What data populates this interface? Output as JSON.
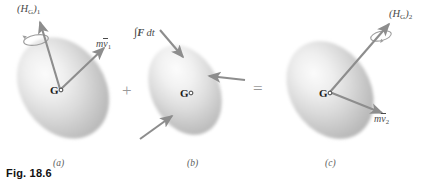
{
  "figure": {
    "caption": "Fig. 18.6",
    "panels": [
      {
        "id": "a",
        "letter": "(a)",
        "labels": {
          "angular_momentum": "(H",
          "angular_momentum_sub": "G",
          "angular_momentum_close": ")",
          "angular_momentum_index": "1",
          "linear_momentum_m": "m",
          "linear_momentum_v": "v",
          "linear_momentum_index": "1",
          "centroid": "G"
        }
      },
      {
        "id": "b",
        "letter": "(b)",
        "labels": {
          "impulse_integral": "∫",
          "impulse_force": "F",
          "impulse_dt": "dt",
          "centroid": "G"
        }
      },
      {
        "id": "c",
        "letter": "(c)",
        "labels": {
          "angular_momentum": "(H",
          "angular_momentum_sub": "G",
          "angular_momentum_close": ")",
          "angular_momentum_index": "2",
          "linear_momentum_m": "m",
          "linear_momentum_v": "v",
          "linear_momentum_index": "2",
          "centroid": "G"
        }
      }
    ],
    "operators": {
      "plus": "+",
      "equals": "="
    },
    "colors": {
      "arrow": "#8d8d8d",
      "body_light": "#f2f2f2",
      "body_mid": "#d2d2d2",
      "body_dark": "#b4b4b4",
      "text": "#4a4a4a",
      "caption": "#111111"
    }
  }
}
